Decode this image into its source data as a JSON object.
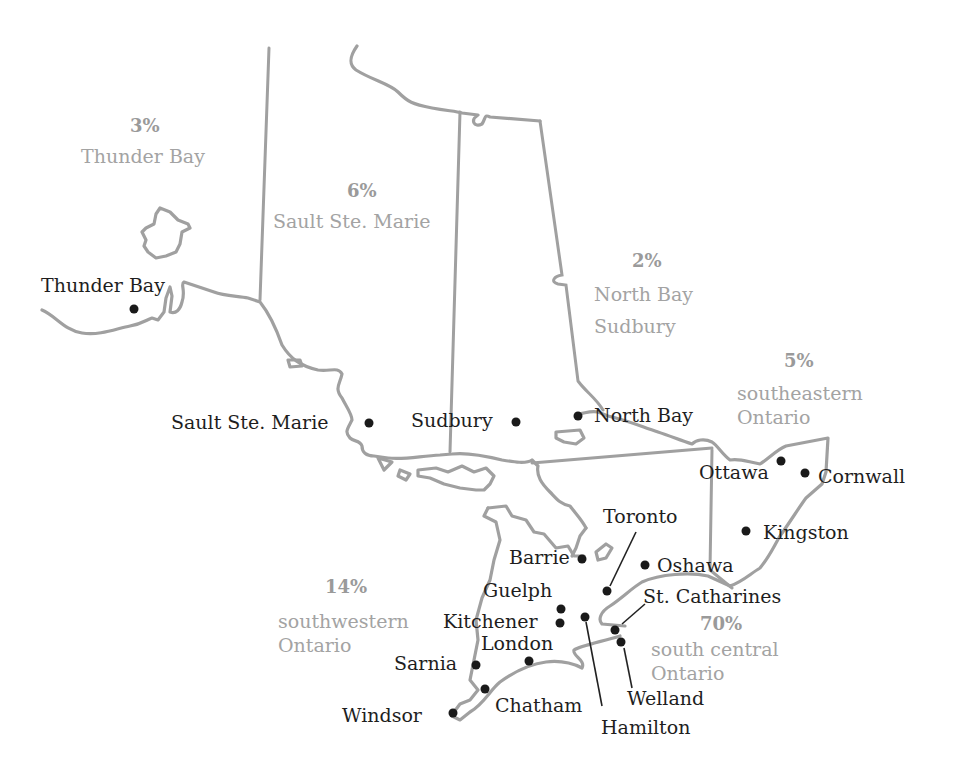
{
  "map": {
    "subject": "Ontario regions",
    "colors": {
      "boundary": "#a0a0a0",
      "city": "#1e1e1e",
      "region_label": "#a3a3a3"
    },
    "regions": [
      {
        "id": "thunder-bay",
        "percent": "3%",
        "name_lines": [
          "Thunder Bay"
        ]
      },
      {
        "id": "sault-ste-marie",
        "percent": "6%",
        "name_lines": [
          "Sault Ste. Marie"
        ]
      },
      {
        "id": "north-bay-sudbury",
        "percent": "2%",
        "name_lines": [
          "North Bay",
          "Sudbury"
        ]
      },
      {
        "id": "southeastern-ontario",
        "percent": "5%",
        "name_lines": [
          "southeastern",
          "Ontario"
        ]
      },
      {
        "id": "southwestern-ontario",
        "percent": "14%",
        "name_lines": [
          "southwestern",
          "Ontario"
        ]
      },
      {
        "id": "south-central-ontario",
        "percent": "70%",
        "name_lines": [
          "south central",
          "Ontario"
        ]
      }
    ],
    "cities": [
      {
        "name": "Thunder Bay"
      },
      {
        "name": "Sault Ste. Marie"
      },
      {
        "name": "Sudbury"
      },
      {
        "name": "North Bay"
      },
      {
        "name": "Ottawa"
      },
      {
        "name": "Cornwall"
      },
      {
        "name": "Kingston"
      },
      {
        "name": "Toronto"
      },
      {
        "name": "Barrie"
      },
      {
        "name": "Oshawa"
      },
      {
        "name": "Guelph"
      },
      {
        "name": "St. Catharines"
      },
      {
        "name": "Kitchener"
      },
      {
        "name": "London"
      },
      {
        "name": "Sarnia"
      },
      {
        "name": "Chatham"
      },
      {
        "name": "Welland"
      },
      {
        "name": "Windsor"
      },
      {
        "name": "Hamilton"
      }
    ]
  }
}
